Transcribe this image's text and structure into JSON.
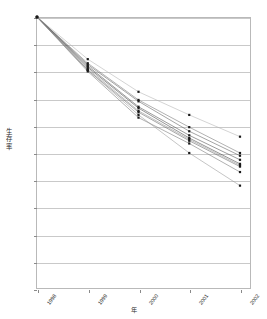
{
  "chart_data": {
    "type": "line",
    "title": "",
    "xlabel": "年",
    "ylabel": "生存率",
    "ylabel_chars": [
      "生",
      "存",
      "率"
    ],
    "categories": [
      "1998",
      "1999",
      "2000",
      "2001",
      "2002"
    ],
    "x": [
      1998,
      1999,
      2000,
      2001,
      2002
    ],
    "ylim": [
      0,
      100
    ],
    "ytick_labels": [
      "100.0%",
      "90.0%",
      "80.0%",
      "70.0%",
      "60.0%",
      "50.0%",
      "40.0%",
      "30.0%",
      "20.0%",
      "10.0%",
      "0.0%"
    ],
    "ytick_values": [
      100,
      90,
      80,
      70,
      60,
      50,
      40,
      30,
      20,
      10,
      0
    ],
    "yunit": "%",
    "ytick_step": 10,
    "grid": "horizontal",
    "legend": "none",
    "marker": "square",
    "marker_color": "#1a1a1a",
    "series": [
      {
        "name": "series-1",
        "color": "#b0b0b0",
        "values": [
          100.0,
          84.5,
          72.5,
          64.0,
          56.0
        ]
      },
      {
        "name": "series-2",
        "color": "#6f6f6f",
        "values": [
          100.0,
          83.0,
          69.5,
          59.5,
          50.0
        ]
      },
      {
        "name": "series-3",
        "color": "#585858",
        "values": [
          100.0,
          82.5,
          69.0,
          58.0,
          49.0
        ]
      },
      {
        "name": "series-4",
        "color": "#4a4a4a",
        "values": [
          100.0,
          82.0,
          67.0,
          56.5,
          47.5
        ]
      },
      {
        "name": "series-5",
        "color": "#3d3d3d",
        "values": [
          100.0,
          81.5,
          66.5,
          55.5,
          46.0
        ]
      },
      {
        "name": "series-6",
        "color": "#8a8a8a",
        "values": [
          100.0,
          81.0,
          65.5,
          55.0,
          45.5
        ]
      },
      {
        "name": "series-7",
        "color": "#5f5f5f",
        "values": [
          100.0,
          80.5,
          65.0,
          54.5,
          45.0
        ]
      },
      {
        "name": "series-8",
        "color": "#707070",
        "values": [
          100.0,
          80.0,
          63.0,
          53.5,
          43.0
        ]
      },
      {
        "name": "series-9",
        "color": "#949494",
        "values": [
          100.0,
          80.5,
          64.0,
          50.0,
          38.0
        ]
      }
    ],
    "axis_color": "#b9b9b9",
    "grid_color": "#c9c9c9",
    "background": "#ffffff"
  }
}
